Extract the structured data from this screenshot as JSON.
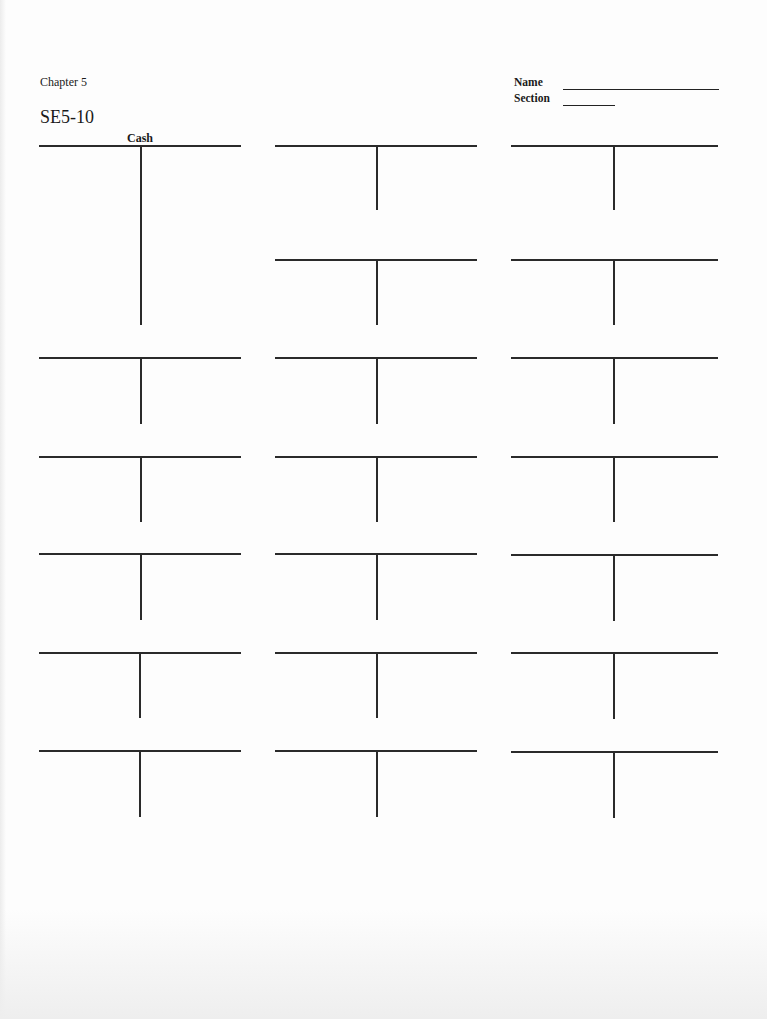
{
  "header": {
    "chapter": "Chapter 5",
    "exercise": "SE5-10",
    "name_label": "Name",
    "section_label": "Section",
    "name_value": "",
    "section_value": ""
  },
  "t_accounts": [
    {
      "id": "cash",
      "label": "Cash",
      "x": 39,
      "y": 145,
      "w": 202,
      "stem_x": 101,
      "stem_h": 180
    },
    {
      "id": "r1c2",
      "label": "",
      "x": 275,
      "y": 145,
      "w": 202,
      "stem_x": 101,
      "stem_h": 65
    },
    {
      "id": "r1c3",
      "label": "",
      "x": 511,
      "y": 145,
      "w": 207,
      "stem_x": 102,
      "stem_h": 65
    },
    {
      "id": "r2c2",
      "label": "",
      "x": 275,
      "y": 259,
      "w": 202,
      "stem_x": 101,
      "stem_h": 66
    },
    {
      "id": "r2c3",
      "label": "",
      "x": 511,
      "y": 259,
      "w": 207,
      "stem_x": 102,
      "stem_h": 66
    },
    {
      "id": "r3c1",
      "label": "",
      "x": 39,
      "y": 357,
      "w": 202,
      "stem_x": 101,
      "stem_h": 67
    },
    {
      "id": "r3c2",
      "label": "",
      "x": 275,
      "y": 357,
      "w": 202,
      "stem_x": 101,
      "stem_h": 67
    },
    {
      "id": "r3c3",
      "label": "",
      "x": 511,
      "y": 357,
      "w": 207,
      "stem_x": 102,
      "stem_h": 67
    },
    {
      "id": "r4c1",
      "label": "",
      "x": 39,
      "y": 456,
      "w": 202,
      "stem_x": 101,
      "stem_h": 66
    },
    {
      "id": "r4c2",
      "label": "",
      "x": 275,
      "y": 456,
      "w": 202,
      "stem_x": 101,
      "stem_h": 66
    },
    {
      "id": "r4c3",
      "label": "",
      "x": 511,
      "y": 456,
      "w": 207,
      "stem_x": 102,
      "stem_h": 66
    },
    {
      "id": "r5c1",
      "label": "",
      "x": 39,
      "y": 553,
      "w": 202,
      "stem_x": 101,
      "stem_h": 67
    },
    {
      "id": "r5c2",
      "label": "",
      "x": 275,
      "y": 553,
      "w": 202,
      "stem_x": 101,
      "stem_h": 67
    },
    {
      "id": "r5c3",
      "label": "",
      "x": 511,
      "y": 554,
      "w": 207,
      "stem_x": 102,
      "stem_h": 67
    },
    {
      "id": "r6c1",
      "label": "",
      "x": 39,
      "y": 652,
      "w": 202,
      "stem_x": 100,
      "stem_h": 66
    },
    {
      "id": "r6c2",
      "label": "",
      "x": 275,
      "y": 652,
      "w": 202,
      "stem_x": 101,
      "stem_h": 66
    },
    {
      "id": "r6c3",
      "label": "",
      "x": 511,
      "y": 652,
      "w": 207,
      "stem_x": 102,
      "stem_h": 67
    },
    {
      "id": "r7c1",
      "label": "",
      "x": 39,
      "y": 750,
      "w": 202,
      "stem_x": 100,
      "stem_h": 67
    },
    {
      "id": "r7c2",
      "label": "",
      "x": 275,
      "y": 750,
      "w": 202,
      "stem_x": 101,
      "stem_h": 67
    },
    {
      "id": "r7c3",
      "label": "",
      "x": 511,
      "y": 751,
      "w": 207,
      "stem_x": 102,
      "stem_h": 67
    }
  ]
}
